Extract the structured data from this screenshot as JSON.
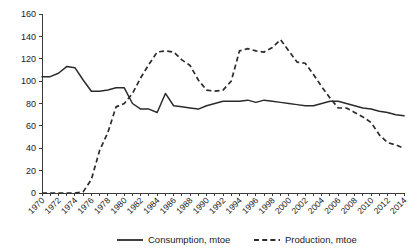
{
  "chart_data": {
    "type": "line",
    "title": "",
    "subtitle": "",
    "xlabel": "",
    "ylabel": "",
    "ylim": [
      0,
      160
    ],
    "ytick_step": 20,
    "yticks": [
      0,
      20,
      40,
      60,
      80,
      100,
      120,
      140,
      160
    ],
    "grid": false,
    "legend_position": "bottom-center",
    "x": [
      1970,
      1971,
      1972,
      1973,
      1974,
      1975,
      1976,
      1977,
      1978,
      1979,
      1980,
      1981,
      1982,
      1983,
      1984,
      1985,
      1986,
      1987,
      1988,
      1989,
      1990,
      1991,
      1992,
      1993,
      1994,
      1995,
      1996,
      1997,
      1998,
      1999,
      2000,
      2001,
      2002,
      2003,
      2004,
      2005,
      2006,
      2007,
      2008,
      2009,
      2010,
      2011,
      2012,
      2013,
      2014
    ],
    "xtick_labels": [
      "1970",
      "1972",
      "1974",
      "1976",
      "1978",
      "1980",
      "1982",
      "1984",
      "1986",
      "1988",
      "1990",
      "1992",
      "1994",
      "1996",
      "1998",
      "2000",
      "2002",
      "2004",
      "2006",
      "2008",
      "2010",
      "2012",
      "2014"
    ],
    "units": "mtoe",
    "series": [
      {
        "name": "Consumption, mtoe",
        "style": "solid",
        "color": "#2b2b2b",
        "values": [
          104,
          104,
          107,
          113,
          112,
          101,
          91,
          91,
          92,
          94,
          94,
          80,
          75,
          75,
          72,
          89,
          78,
          77,
          76,
          75,
          78,
          80,
          82,
          82,
          82,
          83,
          81,
          83,
          82,
          81,
          80,
          79,
          78,
          78,
          80,
          82,
          82,
          80,
          78,
          76,
          75,
          73,
          72,
          70,
          69
        ]
      },
      {
        "name": "Production, mtoe",
        "style": "dashed",
        "color": "#2b2b2b",
        "values": [
          0,
          0,
          0,
          0,
          0,
          1,
          12,
          38,
          54,
          77,
          80,
          89,
          103,
          115,
          126,
          127,
          126,
          119,
          114,
          101,
          92,
          91,
          92,
          100,
          127,
          129,
          127,
          126,
          130,
          137,
          127,
          117,
          116,
          106,
          95,
          85,
          76,
          76,
          72,
          68,
          63,
          52,
          45,
          43,
          40
        ]
      }
    ]
  },
  "legend": {
    "items": [
      {
        "label": "Consumption, mtoe",
        "style": "solid"
      },
      {
        "label": "Production, mtoe",
        "style": "dashed"
      }
    ]
  }
}
